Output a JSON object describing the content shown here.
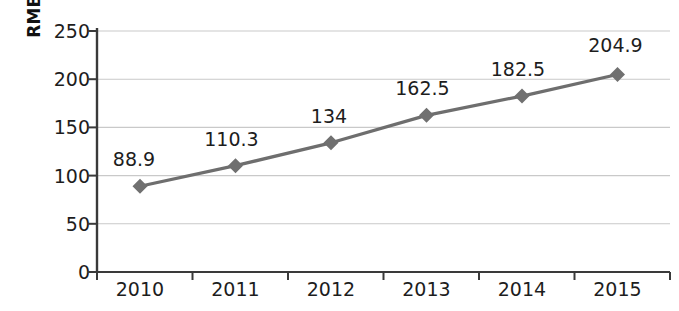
{
  "chart_data": {
    "type": "line",
    "title": "",
    "subtitle": "",
    "xlabel": "",
    "ylabel": "RMB billions",
    "categories": [
      "2010",
      "2011",
      "2012",
      "2013",
      "2014",
      "2015"
    ],
    "values": [
      88.9,
      110.3,
      134,
      162.5,
      182.5,
      204.9
    ],
    "point_labels": [
      "88.9",
      "110.3",
      "134",
      "162.5",
      "182.5",
      "204.9"
    ],
    "series": [
      {
        "name": "RMB billions",
        "values": [
          88.9,
          110.3,
          134,
          162.5,
          182.5,
          204.9
        ]
      }
    ],
    "ylim": [
      0,
      250
    ],
    "ytick_step": 50,
    "ytick_labels": [
      "0",
      "50",
      "100",
      "150",
      "200",
      "250"
    ],
    "ytick_values": [
      0,
      50,
      100,
      150,
      200,
      250
    ],
    "xtick_labels": [
      "2010",
      "2011",
      "2012",
      "2013",
      "2014",
      "2015"
    ],
    "grid": true,
    "grid_axis": "y",
    "legend": false,
    "legend_position": "none",
    "marker": "diamond",
    "colors": {
      "line": "#6e6e6e",
      "marker": "#707070",
      "grid": "#c9c9c9",
      "axis": "#3a3a3a",
      "text": "#1d1d1d",
      "background": "#ffffff"
    }
  }
}
